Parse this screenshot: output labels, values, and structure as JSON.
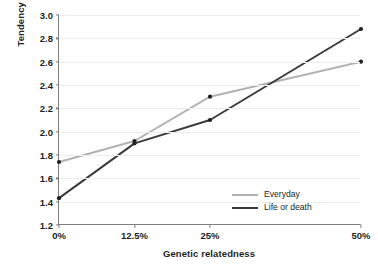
{
  "chart_data": {
    "type": "line",
    "title": "",
    "xlabel": "Genetic relatedness",
    "ylabel": "Tendency to help",
    "categories": [
      "0%",
      "12.5%",
      "25%",
      "50%"
    ],
    "x": [
      0,
      12.5,
      25,
      50
    ],
    "xlim": [
      0,
      50
    ],
    "ylim": [
      1.2,
      3.0
    ],
    "yticks": [
      "1.2",
      "1.4",
      "1.6",
      "1.8",
      "2.0",
      "2.2",
      "2.4",
      "2.6",
      "2.8",
      "3.0"
    ],
    "ytick_values": [
      1.2,
      1.4,
      1.6,
      1.8,
      2.0,
      2.2,
      2.4,
      2.6,
      2.8,
      3.0
    ],
    "grid": true,
    "grid_axis": "y",
    "legend_position": "bottom-right",
    "series": [
      {
        "name": "Everyday",
        "color": "#b3b3b3",
        "values": [
          1.74,
          1.92,
          2.3,
          2.6
        ],
        "marker": "dot"
      },
      {
        "name": "Life or death",
        "color": "#3b3b3b",
        "values": [
          1.43,
          1.9,
          2.1,
          2.88
        ],
        "marker": "dot"
      }
    ]
  },
  "colors": {
    "background": "#ffffff",
    "axis": "#7d7d7d",
    "grid": "#ededed",
    "text": "#231f20",
    "everyday": "#b3b3b3",
    "life_or_death": "#3b3b3b"
  }
}
